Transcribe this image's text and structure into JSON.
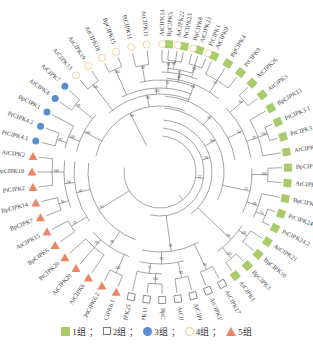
{
  "figure": {
    "type": "circular-phylogenetic-tree",
    "center": [
      160,
      172
    ],
    "tip_radius": 128,
    "label_radius": 140
  },
  "colors": {
    "group1": "#a9cc6a",
    "group2": "#777777",
    "group3": "#5b8ccf",
    "group4": "#f0c98a",
    "group5": "#ee8466",
    "branch": "#666666"
  },
  "legend": {
    "items": [
      {
        "group": "group1",
        "shape": "square-filled",
        "label": "1组",
        "sep": "；"
      },
      {
        "group": "group2",
        "shape": "square-open",
        "label": "2组",
        "sep": "；"
      },
      {
        "group": "group3",
        "shape": "circle-filled",
        "label": "3组",
        "sep": "；"
      },
      {
        "group": "group4",
        "shape": "circle-open",
        "label": "4组",
        "sep": "；"
      },
      {
        "group": "group5",
        "shape": "triangle-filled",
        "label": "5组",
        "sep": ""
      }
    ]
  },
  "leaves": [
    {
      "label": "BpCIPK5",
      "group": "group1",
      "angle": -86
    },
    {
      "label": "PtCIPK23",
      "group": "group1",
      "angle": -79
    },
    {
      "label": "AtCIPK23",
      "group": "group1",
      "angle": -72
    },
    {
      "label": "AtCIPK9",
      "group": "group1",
      "angle": -65
    },
    {
      "label": "BpCIPK4",
      "group": "group1",
      "angle": -58
    },
    {
      "label": "PtCIPK9",
      "group": "group1",
      "angle": -51
    },
    {
      "label": "AtCIPK26",
      "group": "group1",
      "angle": -44
    },
    {
      "label": "AtCIPK3",
      "group": "group1",
      "angle": -37
    },
    {
      "label": "BpCIPK13",
      "group": "group1",
      "angle": -30
    },
    {
      "label": "PtCIPK3.1",
      "group": "group1",
      "angle": -23
    },
    {
      "label": "PtCIPK3.2",
      "group": "group1",
      "angle": -16
    },
    {
      "label": "AtCIPK8",
      "group": "group1",
      "angle": -9
    },
    {
      "label": "BpCIPK9",
      "group": "group1",
      "angle": -2
    },
    {
      "label": "AtCIPK24",
      "group": "group1",
      "angle": 5
    },
    {
      "label": "BpCIPK12",
      "group": "group1",
      "angle": 12
    },
    {
      "label": "PtCIPK24.1",
      "group": "group1",
      "angle": 19
    },
    {
      "label": "PtCIPK24.2",
      "group": "group1",
      "angle": 26
    },
    {
      "label": "AtCIPK21",
      "group": "group1",
      "angle": 33
    },
    {
      "label": "BpCIPK10",
      "group": "group1",
      "angle": 40
    },
    {
      "label": "BpCIPK3",
      "group": "group1",
      "angle": 47
    },
    {
      "label": "AtCIPK1",
      "group": "group1",
      "angle": 54
    },
    {
      "label": "AtCIPK17",
      "group": "group2",
      "angle": 61
    },
    {
      "label": "AtCIPK16",
      "group": "group2",
      "angle": 68
    },
    {
      "label": "AtCIPK25",
      "group": "group2",
      "angle": 75
    },
    {
      "label": "AtCIPK5",
      "group": "group2",
      "angle": 82
    },
    {
      "label": "BpCIPK2",
      "group": "group2",
      "angle": 89
    },
    {
      "label": "BpCIPK11",
      "group": "group2",
      "angle": 96
    },
    {
      "label": "PtCIPK25",
      "group": "group2",
      "angle": 103
    },
    {
      "label": "PtCIPK6.1",
      "group": "group5",
      "angle": 110
    },
    {
      "label": "PtCIPK6.2",
      "group": "group5",
      "angle": 117
    },
    {
      "label": "AtCIPK6",
      "group": "group5",
      "angle": 124
    },
    {
      "label": "AtCIPK20",
      "group": "group5",
      "angle": 131
    },
    {
      "label": "PtCIPK20",
      "group": "group5",
      "angle": 138
    },
    {
      "label": "BpCIPK6",
      "group": "group5",
      "angle": 145
    },
    {
      "label": "AtCIPK15",
      "group": "group5",
      "angle": 152
    },
    {
      "label": "BpCIPK7",
      "group": "group5",
      "angle": 159
    },
    {
      "label": "BpCIPK14",
      "group": "group5",
      "angle": 166
    },
    {
      "label": "PtCIPK2",
      "group": "group5",
      "angle": 173
    },
    {
      "label": "BpCIPK10",
      "group": "group5",
      "angle": 180
    },
    {
      "label": "AtCIPK2",
      "group": "group5",
      "angle": 187
    },
    {
      "label": "PtCIPK4.1",
      "group": "group3",
      "angle": 194
    },
    {
      "label": "PtCIPK4.2",
      "group": "group3",
      "angle": 201
    },
    {
      "label": "BpCIPK1",
      "group": "group3",
      "angle": 208
    },
    {
      "label": "AtCIPK4",
      "group": "group3",
      "angle": 215
    },
    {
      "label": "AtCIPK7",
      "group": "group3",
      "angle": 222
    },
    {
      "label": "AtCIPK13",
      "group": "group4",
      "angle": 229
    },
    {
      "label": "AtCIPK19",
      "group": "group4",
      "angle": 236
    },
    {
      "label": "AtCIPK18",
      "group": "group4",
      "angle": 243
    },
    {
      "label": "BpCIPK15",
      "group": "group4",
      "angle": 250
    },
    {
      "label": "PtCIPK11",
      "group": "group4",
      "angle": 257
    },
    {
      "label": "AtCIPK11",
      "group": "group4",
      "angle": 264
    },
    {
      "label": "AtCIPK14",
      "group": "group4",
      "angle": 271
    },
    {
      "label": "AtCIPK22",
      "group": "group4",
      "angle": 278
    },
    {
      "label": "BpCIPK8",
      "group": "group4",
      "angle": 285
    },
    {
      "label": "PtCIPK1",
      "group": "group4",
      "angle": 292
    }
  ],
  "clades": [
    {
      "from": 0,
      "to": 1,
      "r": 112,
      "support": "87"
    },
    {
      "from": 0,
      "to": 2,
      "r": 104,
      "support": "77"
    },
    {
      "from": 3,
      "to": 5,
      "r": 108,
      "support": "99"
    },
    {
      "from": 0,
      "to": 5,
      "r": 94,
      "support": "65"
    },
    {
      "from": 6,
      "to": 7,
      "r": 110,
      "support": "64"
    },
    {
      "from": 9,
      "to": 10,
      "r": 114,
      "support": "100"
    },
    {
      "from": 8,
      "to": 11,
      "r": 104,
      "support": "97"
    },
    {
      "from": 6,
      "to": 11,
      "r": 92,
      "support": "54"
    },
    {
      "from": 0,
      "to": 11,
      "r": 76,
      "support": "38"
    },
    {
      "from": 12,
      "to": 13,
      "r": 108,
      "support": "100"
    },
    {
      "from": 15,
      "to": 16,
      "r": 114,
      "support": "75"
    },
    {
      "from": 14,
      "to": 16,
      "r": 104,
      "support": "98"
    },
    {
      "from": 12,
      "to": 16,
      "r": 92,
      "support": "53"
    },
    {
      "from": 0,
      "to": 16,
      "r": 64,
      "support": "100"
    },
    {
      "from": 17,
      "to": 18,
      "r": 108,
      "support": "100"
    },
    {
      "from": 19,
      "to": 20,
      "r": 112,
      "support": "100"
    },
    {
      "from": 17,
      "to": 20,
      "r": 98,
      "support": "98"
    },
    {
      "from": 0,
      "to": 20,
      "r": 52,
      "support": "96"
    },
    {
      "from": 21,
      "to": 22,
      "r": 108,
      "support": "98"
    },
    {
      "from": 23,
      "to": 24,
      "r": 108,
      "support": "99"
    },
    {
      "from": 25,
      "to": 26,
      "r": 112,
      "support": "100"
    },
    {
      "from": 25,
      "to": 27,
      "r": 102,
      "support": "71"
    },
    {
      "from": 23,
      "to": 27,
      "r": 92,
      "support": "96"
    },
    {
      "from": 21,
      "to": 27,
      "r": 80,
      "support": "96"
    },
    {
      "from": 0,
      "to": 27,
      "r": 44,
      "support": "32"
    },
    {
      "from": 28,
      "to": 29,
      "r": 110,
      "support": "100"
    },
    {
      "from": 30,
      "to": 32,
      "r": 100,
      "support": "96"
    },
    {
      "from": 28,
      "to": 32,
      "r": 90,
      "support": "99"
    },
    {
      "from": 33,
      "to": 34,
      "r": 104,
      "support": "92"
    },
    {
      "from": 35,
      "to": 36,
      "r": 106,
      "support": "91"
    },
    {
      "from": 37,
      "to": 39,
      "r": 108,
      "support": "100"
    },
    {
      "from": 35,
      "to": 39,
      "r": 96,
      "support": "64"
    },
    {
      "from": 33,
      "to": 39,
      "r": 86,
      "support": "46"
    },
    {
      "from": 28,
      "to": 39,
      "r": 72,
      "support": "61"
    },
    {
      "from": 0,
      "to": 39,
      "r": 36,
      "support": ""
    },
    {
      "from": 40,
      "to": 41,
      "r": 108,
      "support": "87"
    },
    {
      "from": 40,
      "to": 42,
      "r": 98,
      "support": "100"
    },
    {
      "from": 43,
      "to": 44,
      "r": 108,
      "support": "99"
    },
    {
      "from": 40,
      "to": 44,
      "r": 86,
      "support": "100"
    },
    {
      "from": 45,
      "to": 46,
      "r": 110,
      "support": "100"
    },
    {
      "from": 47,
      "to": 48,
      "r": 112,
      "support": "100"
    },
    {
      "from": 49,
      "to": 50,
      "r": 108,
      "support": "58"
    },
    {
      "from": 51,
      "to": 52,
      "r": 110,
      "support": "99"
    },
    {
      "from": 53,
      "to": 54,
      "r": 112,
      "support": "95"
    },
    {
      "from": 51,
      "to": 54,
      "r": 100,
      "support": "41"
    },
    {
      "from": 49,
      "to": 54,
      "r": 92,
      "support": "73"
    },
    {
      "from": 47,
      "to": 54,
      "r": 84,
      "support": "100"
    },
    {
      "from": 45,
      "to": 54,
      "r": 78,
      "support": "98"
    },
    {
      "from": 40,
      "to": 54,
      "r": 66,
      "support": "98"
    }
  ]
}
